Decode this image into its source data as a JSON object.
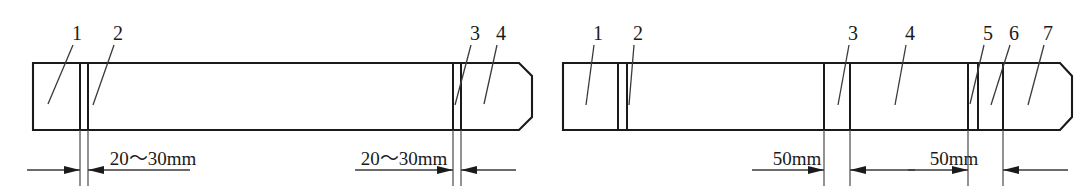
{
  "figure": {
    "title": "",
    "background_color": "#ffffff",
    "line_color": "#1a1a1a",
    "width": 1084,
    "height": 193
  },
  "diagrams": [
    {
      "id": "left-assembly",
      "name": "left-rod-assembly",
      "reference_labels": [
        {
          "text": "1",
          "x": 77,
          "y": 40
        },
        {
          "text": "2",
          "x": 118,
          "y": 40
        },
        {
          "text": "3",
          "x": 475,
          "y": 40
        },
        {
          "text": "4",
          "x": 501,
          "y": 40
        }
      ],
      "dimensions": [
        {
          "text": "20～30mm",
          "x": 153,
          "y": 165
        },
        {
          "text": "20～30mm",
          "x": 404,
          "y": 165
        }
      ]
    },
    {
      "id": "right-assembly",
      "name": "right-rod-assembly",
      "reference_labels": [
        {
          "text": "1",
          "x": 598,
          "y": 40
        },
        {
          "text": "2",
          "x": 638,
          "y": 40
        },
        {
          "text": "3",
          "x": 853,
          "y": 40
        },
        {
          "text": "4",
          "x": 910,
          "y": 40
        },
        {
          "text": "5",
          "x": 988,
          "y": 40
        },
        {
          "text": "6",
          "x": 1014,
          "y": 40
        },
        {
          "text": "7",
          "x": 1048,
          "y": 40
        }
      ],
      "dimensions": [
        {
          "text": "50mm",
          "x": 797,
          "y": 165
        },
        {
          "text": "50mm",
          "x": 954,
          "y": 165
        }
      ]
    }
  ]
}
